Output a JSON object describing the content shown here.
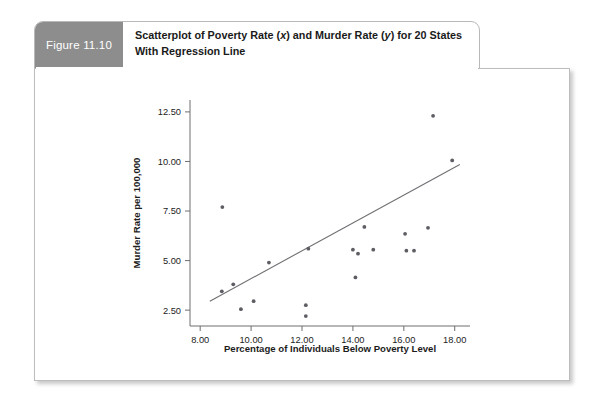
{
  "figure": {
    "tab_label": "Figure 11.10",
    "title_line1_pre": "Scatterplot of Poverty Rate (",
    "title_line1_x": "x",
    "title_line1_mid": ") and Murder Rate (",
    "title_line1_y": "y",
    "title_line1_post": ") for 20 States With",
    "title_line2": "Regression Line",
    "title_full": "Scatterplot of Poverty Rate (x) and Murder Rate (y) for 20 States With Regression Line",
    "tab_color": "#8d8d8d",
    "point_color": "#5d5d63",
    "line_color": "#6f6f74",
    "axis_color": "#6e6e6e"
  },
  "chart_data": {
    "type": "scatter",
    "title": "Scatterplot of Poverty Rate (x) and Murder Rate (y) for 20 States With Regression Line",
    "xlabel": "Percentage of Individuals Below Poverty Level",
    "ylabel": "Murder Rate per 100,000",
    "xlim": [
      7.6,
      18.6
    ],
    "ylim": [
      1.7,
      13.1
    ],
    "xticks": [
      8.0,
      10.0,
      12.0,
      14.0,
      16.0,
      18.0
    ],
    "xticklabels": [
      "8.00",
      "10.00",
      "12.00",
      "14.00",
      "16.00",
      "18.00"
    ],
    "yticks": [
      2.5,
      5.0,
      7.5,
      10.0,
      12.5
    ],
    "yticklabels": [
      "2.50",
      "5.00",
      "7.50",
      "10.00",
      "12.50"
    ],
    "grid": false,
    "legend": null,
    "n_points": 20,
    "points": [
      {
        "x": 8.87,
        "y": 7.7
      },
      {
        "x": 8.85,
        "y": 3.45
      },
      {
        "x": 9.3,
        "y": 3.8
      },
      {
        "x": 9.6,
        "y": 2.55
      },
      {
        "x": 10.1,
        "y": 2.95
      },
      {
        "x": 10.7,
        "y": 4.9
      },
      {
        "x": 12.15,
        "y": 2.75
      },
      {
        "x": 12.15,
        "y": 2.2
      },
      {
        "x": 12.25,
        "y": 5.6
      },
      {
        "x": 14.0,
        "y": 5.55
      },
      {
        "x": 14.1,
        "y": 4.15
      },
      {
        "x": 14.2,
        "y": 5.35
      },
      {
        "x": 14.45,
        "y": 6.7
      },
      {
        "x": 14.8,
        "y": 5.55
      },
      {
        "x": 16.05,
        "y": 6.35
      },
      {
        "x": 16.1,
        "y": 5.5
      },
      {
        "x": 16.4,
        "y": 5.5
      },
      {
        "x": 16.95,
        "y": 6.65
      },
      {
        "x": 17.15,
        "y": 12.3
      },
      {
        "x": 17.9,
        "y": 10.05
      }
    ],
    "regression_line": {
      "x_start": 8.38,
      "y_start": 2.95,
      "x_end": 18.2,
      "y_end": 9.85,
      "slope": 0.7,
      "intercept": -2.94
    }
  }
}
